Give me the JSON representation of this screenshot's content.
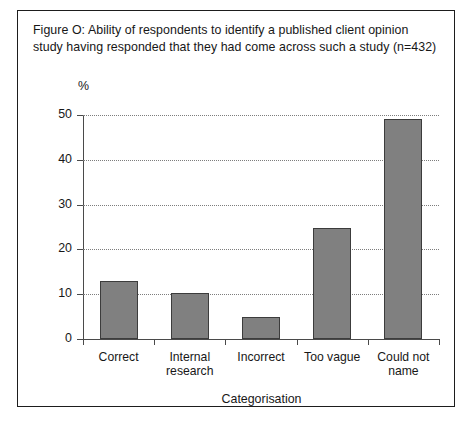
{
  "figure": {
    "caption": "Figure O: Ability of respondents to identify a published client opinion study having responded that they had come across such a study (n=432)",
    "frame_color": "#1d1d1d",
    "background": "#ffffff"
  },
  "chart_data": {
    "type": "bar",
    "title": "Figure O: Ability of respondents to identify a published client opinion study having responded that they had come across such a study (n=432)",
    "categories": [
      "Correct",
      "Internal research",
      "Incorrect",
      "Too vague",
      "Could not name"
    ],
    "category_lines": [
      [
        "Correct"
      ],
      [
        "Internal",
        "research"
      ],
      [
        "Incorrect"
      ],
      [
        "Too vague"
      ],
      [
        "Could not",
        "name"
      ]
    ],
    "values": [
      13,
      10.2,
      5,
      24.8,
      49
    ],
    "xlabel": "Categorisation",
    "ylabel": "%",
    "ylim": [
      0,
      50
    ],
    "yticks": [
      0,
      10,
      20,
      30,
      40,
      50
    ],
    "ytick_labels": [
      "0",
      "10",
      "20",
      "30",
      "40",
      "50"
    ],
    "grid": true,
    "grid_axis": "y",
    "grid_style": "dotted",
    "legend": "none",
    "bar_fill": "#808080",
    "bar_border": "#3c3c3c",
    "sample_size": "n=432"
  }
}
